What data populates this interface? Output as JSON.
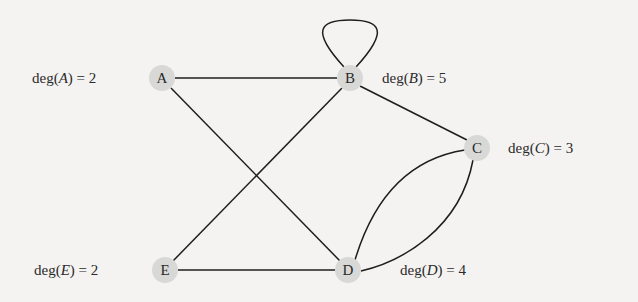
{
  "graph": {
    "nodes": [
      {
        "id": "A",
        "label": "A",
        "degree_label": "deg(A) = 2",
        "degree": 2
      },
      {
        "id": "B",
        "label": "B",
        "degree_label": "deg(B) = 5",
        "degree": 5
      },
      {
        "id": "C",
        "label": "C",
        "degree_label": "deg(C) = 3",
        "degree": 3
      },
      {
        "id": "D",
        "label": "D",
        "degree_label": "deg(D) = 4",
        "degree": 4
      },
      {
        "id": "E",
        "label": "E",
        "degree_label": "deg(E) = 2",
        "degree": 2
      }
    ],
    "edges": [
      [
        "A",
        "B"
      ],
      [
        "A",
        "D"
      ],
      [
        "B",
        "B"
      ],
      [
        "B",
        "E"
      ],
      [
        "B",
        "C"
      ],
      [
        "C",
        "D"
      ],
      [
        "C",
        "D"
      ],
      [
        "E",
        "D"
      ]
    ]
  },
  "labels": {
    "A": {
      "pre": "deg(",
      "var": "A",
      "post": ") = 2"
    },
    "B": {
      "pre": "deg(",
      "var": "B",
      "post": ") = 5"
    },
    "C": {
      "pre": "deg(",
      "var": "C",
      "post": ") = 3"
    },
    "D": {
      "pre": "deg(",
      "var": "D",
      "post": ") = 4"
    },
    "E": {
      "pre": "deg(",
      "var": "E",
      "post": ") = 2"
    }
  }
}
